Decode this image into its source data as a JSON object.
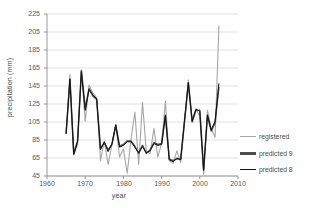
{
  "chart_data": {
    "type": "line",
    "title": "",
    "xlabel": "year",
    "ylabel": "precipitation (mm)",
    "xlim": [
      1960,
      2010
    ],
    "ylim": [
      45,
      225
    ],
    "xticks": [
      1960,
      1970,
      1980,
      1990,
      2000,
      2010
    ],
    "yticks": [
      45,
      65,
      85,
      105,
      125,
      145,
      165,
      185,
      205,
      225
    ],
    "grid": "horizontal",
    "legend_position": "right",
    "legend": [
      "registered",
      "predicted 9",
      "predicted 8"
    ],
    "colors": {
      "registered": "#a6a6a6",
      "predicted_9": "#4d4d4d",
      "predicted_8": "#111111",
      "grid": "#d9d9d9",
      "axis": "#8c8c8c",
      "text": "#4d4d4d"
    },
    "x": [
      1965,
      1966,
      1967,
      1968,
      1969,
      1970,
      1971,
      1972,
      1973,
      1974,
      1975,
      1976,
      1977,
      1978,
      1979,
      1980,
      1981,
      1982,
      1983,
      1984,
      1985,
      1986,
      1987,
      1988,
      1989,
      1990,
      1991,
      1992,
      1993,
      1994,
      1995,
      1996,
      1997,
      1998,
      1999,
      2000,
      2001,
      2002,
      2003,
      2004,
      2005
    ],
    "series": [
      {
        "name": "registered",
        "values": [
          92,
          158,
          68,
          80,
          163,
          106,
          146,
          137,
          132,
          62,
          84,
          58,
          80,
          102,
          66,
          75,
          48,
          86,
          116,
          58,
          127,
          72,
          70,
          98,
          66,
          81,
          128,
          62,
          59,
          73,
          60,
          104,
          152,
          108,
          120,
          111,
          47,
          118,
          98,
          88,
          212
        ]
      },
      {
        "name": "predicted 9",
        "values": [
          92,
          152,
          70,
          84,
          162,
          120,
          142,
          134,
          130,
          76,
          82,
          74,
          80,
          101,
          78,
          80,
          84,
          84,
          78,
          70,
          79,
          70,
          74,
          82,
          80,
          81,
          112,
          64,
          62,
          64,
          64,
          106,
          148,
          105,
          118,
          118,
          52,
          112,
          95,
          104,
          144
        ]
      },
      {
        "name": "predicted 8",
        "values": [
          92,
          153,
          69,
          83,
          161,
          118,
          141,
          135,
          131,
          74,
          83,
          72,
          81,
          102,
          77,
          79,
          83,
          83,
          77,
          71,
          78,
          71,
          73,
          81,
          79,
          80,
          113,
          63,
          61,
          65,
          63,
          107,
          149,
          106,
          119,
          117,
          51,
          113,
          96,
          106,
          148
        ]
      }
    ]
  },
  "legend": {
    "items": [
      {
        "label": "registered",
        "color": "#a6a6a6",
        "thickness": "1.6px"
      },
      {
        "label": "predicted 9",
        "color": "#4d4d4d",
        "thickness": "2.4px"
      },
      {
        "label": "predicted 8",
        "color": "#111111",
        "thickness": "1.8px"
      }
    ]
  },
  "axes": {
    "y_label": "precipitation (mm)",
    "x_label": "year",
    "y_ticks": [
      "225",
      "205",
      "185",
      "165",
      "145",
      "125",
      "105",
      "85",
      "65",
      "45"
    ],
    "x_ticks": [
      "1960",
      "1970",
      "1980",
      "1990",
      "2000",
      "2010"
    ]
  }
}
